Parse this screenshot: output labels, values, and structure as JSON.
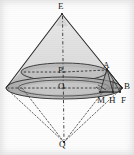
{
  "figure": {
    "type": "solid-geometry-diagram",
    "background_color": "#fdfdfd",
    "stroke_color": "#2a2a2a",
    "shade_light": "#c9c9c9",
    "shade_mid": "#b0b0b0",
    "shade_dark": "#9a9a9a",
    "labels": [
      {
        "id": "E",
        "text": "E",
        "x": 58,
        "y": 2,
        "role": "upper-cone-apex"
      },
      {
        "id": "P",
        "text": "P",
        "x": 58,
        "y": 66,
        "role": "inner-ellipse-center"
      },
      {
        "id": "A",
        "text": "A",
        "x": 103,
        "y": 61,
        "role": "inner-ellipse-right-point"
      },
      {
        "id": "O",
        "text": "O",
        "x": 58,
        "y": 82,
        "role": "base-ellipse-center"
      },
      {
        "id": "B",
        "text": "B",
        "x": 124,
        "y": 82,
        "role": "base-ellipse-right-point"
      },
      {
        "id": "M",
        "text": "M",
        "x": 97,
        "y": 96,
        "role": "foot-point-m"
      },
      {
        "id": "H",
        "text": "H",
        "x": 109,
        "y": 96,
        "role": "foot-point-h"
      },
      {
        "id": "F",
        "text": "F",
        "x": 121,
        "y": 96,
        "role": "foot-point-f"
      },
      {
        "id": "Q",
        "text": "Q",
        "x": 59,
        "y": 140,
        "role": "lower-cone-apex"
      }
    ],
    "points": {
      "E": {
        "x": 62,
        "y": 14
      },
      "Q": {
        "x": 64,
        "y": 142
      },
      "P": {
        "x": 64,
        "y": 72
      },
      "O": {
        "x": 64,
        "y": 88
      },
      "A": {
        "x": 107,
        "y": 69
      },
      "B": {
        "x": 122,
        "y": 88
      },
      "M": {
        "x": 101,
        "y": 92
      },
      "H": {
        "x": 112,
        "y": 92
      },
      "F": {
        "x": 120,
        "y": 92
      }
    },
    "ellipses": {
      "inner": {
        "cx": 64,
        "cy": 72,
        "rx": 43,
        "ry": 9
      },
      "outer": {
        "cx": 64,
        "cy": 88,
        "rx": 58,
        "ry": 11
      }
    }
  }
}
